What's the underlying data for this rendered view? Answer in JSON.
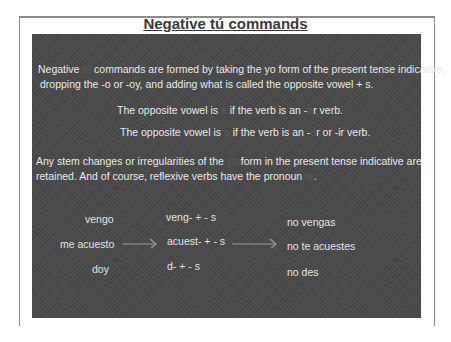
{
  "slide": {
    "title": "Negative tú commands",
    "para1": {
      "a": "Negative ",
      "hidden1": "tú",
      "b": " commands are formed by taking the yo form of the present tense indicative,",
      "line2": "dropping the -o or -oy, and adding what is called the opposite vowel + s."
    },
    "rule1": {
      "a": "The opposite vowel is ",
      "hidden": "e",
      "b": " if the verb is an -",
      "hidden2": "a",
      "c": "r verb."
    },
    "rule2": {
      "a": "The opposite vowel is ",
      "hidden": "a",
      "b": " if the verb is an -",
      "hidden2": "e",
      "c": "r or -ir verb."
    },
    "para2": {
      "a": "Any stem changes or irregularities of the ",
      "hidden1": "yo",
      "b": " form in the present tense indicative are",
      "c": "retained. And of course, reflexive verbs have the pronoun ",
      "hidden2": "te",
      "d": "."
    },
    "examples": {
      "col1": [
        "vengo",
        "me acuesto",
        "doy"
      ],
      "col2": [
        "veng- + - s",
        "acuest- + - s",
        "d- + - s"
      ],
      "col3": [
        "no vengas",
        "no te acuestes",
        "no des"
      ]
    }
  },
  "colors": {
    "panel": "#4a4a4a",
    "text": "#e8e8e8",
    "title": "#3a3a3a",
    "frame": "#8c8c8c"
  }
}
